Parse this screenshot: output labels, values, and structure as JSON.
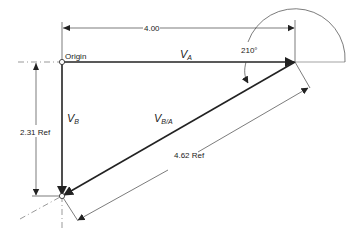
{
  "diagram": {
    "type": "vector-diagram",
    "labels": {
      "origin": "Origin",
      "dim_horizontal": "4.00",
      "dim_vertical": "2.31 Ref",
      "dim_diagonal": "4.62 Ref",
      "angle": "210°",
      "va_main": "V",
      "va_sub": "A",
      "vb_main": "V",
      "vb_sub": "B",
      "vba_main": "V",
      "vba_sub": "B/A"
    },
    "vectors": [
      {
        "name": "V_A",
        "from": [
          62,
          62
        ],
        "to": [
          295,
          62
        ]
      },
      {
        "name": "V_B",
        "from": [
          62,
          62
        ],
        "to": [
          62,
          196
        ]
      },
      {
        "name": "V_B/A",
        "from": [
          295,
          62
        ],
        "to": [
          62,
          196
        ]
      }
    ],
    "colors": {
      "line": "#222222",
      "background": "#ffffff"
    }
  }
}
